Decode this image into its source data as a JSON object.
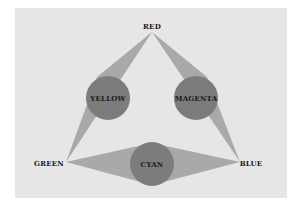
{
  "diagram": {
    "title": "",
    "colors": {
      "panel": "#e6e6e6",
      "wedge": "#a9a9a9",
      "circle": "#7c7c7c",
      "text": "#1a1a1a"
    },
    "primaries": [
      {
        "name": "RED",
        "x": 152,
        "y": 26
      },
      {
        "name": "GREEN",
        "x": 49,
        "y": 166
      },
      {
        "name": "BLUE",
        "x": 251,
        "y": 166
      }
    ],
    "secondaries": [
      {
        "name": "YELLOW",
        "cx": 108,
        "cy": 98
      },
      {
        "name": "MAGENTA",
        "cx": 196,
        "cy": 98
      },
      {
        "name": "CYAN",
        "cx": 152,
        "cy": 164
      }
    ]
  }
}
